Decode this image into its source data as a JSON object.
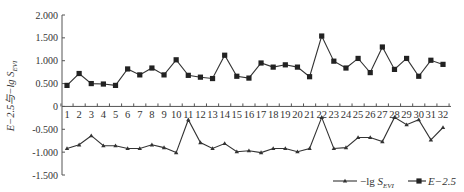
{
  "chart_data": {
    "type": "line",
    "title": "",
    "xlabel": "",
    "ylabel": "E−2.5与−lg S_EVI",
    "ylabel_parts": {
      "main": "E−2.5与−lg ",
      "S": "S",
      "sub": "EVI"
    },
    "ylim": [
      -1.5,
      2.0
    ],
    "yticks": [
      2.0,
      1.5,
      1.0,
      0.5,
      0,
      -0.5,
      -1.0,
      -1.5
    ],
    "ytick_labels": [
      "2.000",
      "1.500",
      "1.000",
      "0.500",
      "0",
      "-0.500",
      "-1.000",
      "-1.500"
    ],
    "grid": false,
    "legend_position": "bottom-right",
    "categories": [
      "1",
      "2",
      "3",
      "4",
      "5",
      "6",
      "7",
      "8",
      "9",
      "10",
      "11",
      "12",
      "13",
      "14",
      "15",
      "16",
      "17",
      "18",
      "19",
      "20",
      "21",
      "22",
      "23",
      "24",
      "25",
      "26",
      "27",
      "28",
      "29",
      "30",
      "31",
      "32"
    ],
    "series": [
      {
        "name": "−lg S_EVI",
        "legend_main": "−lg ",
        "legend_S": "S",
        "legend_sub": "EVI",
        "marker": "triangle",
        "color": "#333333",
        "values": [
          -0.92,
          -0.84,
          -0.64,
          -0.86,
          -0.86,
          -0.92,
          -0.92,
          -0.84,
          -0.9,
          -1.01,
          -0.29,
          -0.79,
          -0.92,
          -0.81,
          -0.99,
          -0.97,
          -1.01,
          -0.92,
          -0.92,
          -0.99,
          -0.92,
          -0.24,
          -0.92,
          -0.9,
          -0.68,
          -0.68,
          -0.77,
          -0.24,
          -0.4,
          -0.29,
          -0.73,
          -0.46
        ]
      },
      {
        "name": "E−2.5",
        "legend_main": "E−2.5",
        "marker": "square",
        "color": "#222222",
        "values": [
          0.46,
          0.72,
          0.5,
          0.49,
          0.46,
          0.82,
          0.69,
          0.84,
          0.69,
          1.02,
          0.68,
          0.64,
          0.61,
          1.12,
          0.66,
          0.62,
          0.95,
          0.86,
          0.91,
          0.86,
          0.65,
          1.54,
          0.99,
          0.84,
          1.05,
          0.74,
          1.3,
          0.81,
          1.05,
          0.66,
          1.01,
          0.92
        ]
      }
    ]
  }
}
